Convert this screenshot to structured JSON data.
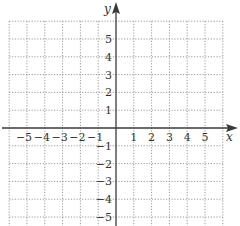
{
  "chart_data": {
    "type": "coordinate-plane",
    "title": "",
    "xlabel": "x",
    "ylabel": "y",
    "xlim": [
      -6,
      6
    ],
    "ylim": [
      -5.5,
      6
    ],
    "grid": true,
    "grid_style": "dotted",
    "x_ticks": [
      -5,
      -4,
      -3,
      -2,
      -1,
      1,
      2,
      3,
      4,
      5
    ],
    "y_ticks": [
      -5,
      -4,
      -3,
      -2,
      -1,
      1,
      2,
      3,
      4,
      5
    ],
    "series": []
  },
  "colors": {
    "axis": "#3a3a3a",
    "grid": "#9a9a9a",
    "text": "#333333",
    "background": "#ffffff"
  }
}
